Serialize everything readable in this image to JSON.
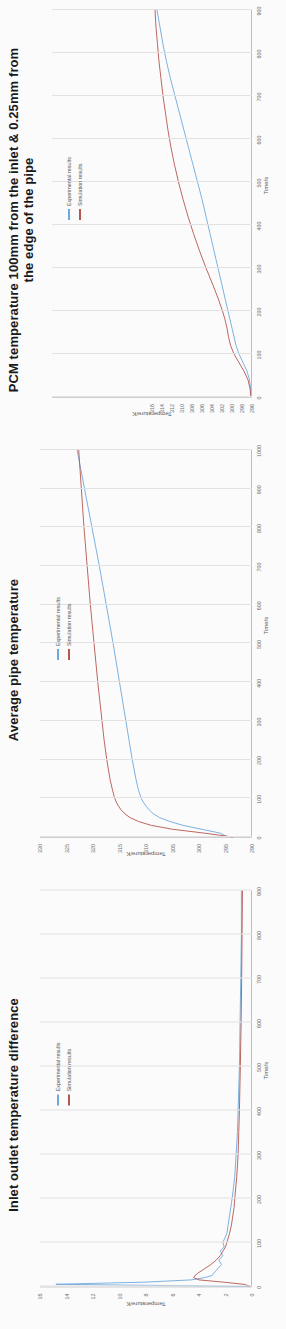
{
  "document": {
    "background": "#fbfbfb",
    "page_kind": "scanned-report-figures"
  },
  "colors": {
    "experimental": "#6fa8dc",
    "simulation": "#b5564f",
    "grid": "#e2e2e2",
    "axis": "#bdbdbd",
    "tick_text": "#6f6f6f",
    "title_text": "#1a1a1a"
  },
  "legend": {
    "experimental_label": "Experimental results",
    "simulation_label": "Simulation results"
  },
  "charts": [
    {
      "id": "pcm-temperature",
      "title_line1": "PCM temperature 100mm from the inlet & 0.25mm from",
      "title_line2": "the edge of the pipe"
    },
    {
      "id": "average-pipe-temperature",
      "title_line1": "Average pipe temperature",
      "title_line2": ""
    },
    {
      "id": "inlet-outlet-temperature-difference",
      "title_line1": "Inlet outlet temperature difference",
      "title_line2": ""
    }
  ],
  "chart_data": [
    {
      "type": "line",
      "title": "PCM temperature 100mm from the inlet & 0.25mm from the edge of the pipe",
      "xlabel": "Time/s",
      "ylabel": "Temperature/K",
      "xlim": [
        0,
        900
      ],
      "ylim": [
        296,
        336
      ],
      "xticks": [
        0,
        100,
        200,
        300,
        400,
        500,
        600,
        700,
        800,
        900
      ],
      "yticks": [
        296,
        298,
        300,
        302,
        304,
        306,
        308,
        310,
        312,
        314,
        316
      ],
      "ytick_labels": [
        "296",
        "298",
        "300",
        "302",
        "304",
        "306",
        "308",
        "310",
        "312",
        "314",
        "316"
      ],
      "grid": true,
      "legend_position": "upper-left",
      "series": [
        {
          "name": "Experimental results",
          "color": "#6fa8dc",
          "x": [
            0,
            20,
            40,
            60,
            80,
            100,
            120,
            140,
            160,
            180,
            200,
            230,
            260,
            300,
            340,
            380,
            420,
            460,
            500,
            540,
            580,
            620,
            660,
            700,
            740,
            780,
            820,
            860,
            900
          ],
          "y": [
            296.2,
            296.3,
            296.5,
            297.0,
            297.8,
            298.6,
            299.2,
            299.6,
            300.0,
            300.4,
            300.8,
            301.4,
            302.0,
            302.8,
            303.6,
            304.4,
            305.2,
            306.0,
            306.9,
            307.8,
            308.7,
            309.6,
            310.5,
            311.4,
            312.3,
            313.1,
            313.8,
            314.4,
            315.0
          ]
        },
        {
          "name": "Simulation results",
          "color": "#b5564f",
          "x": [
            0,
            20,
            40,
            60,
            80,
            100,
            120,
            140,
            160,
            180,
            200,
            230,
            260,
            300,
            340,
            380,
            420,
            460,
            500,
            540,
            580,
            620,
            660,
            700,
            740,
            780,
            820,
            860,
            900
          ],
          "y": [
            296.2,
            296.4,
            296.8,
            297.6,
            298.6,
            299.6,
            300.3,
            300.7,
            301.0,
            301.4,
            301.9,
            302.8,
            303.8,
            305.2,
            306.5,
            307.7,
            308.8,
            309.8,
            310.7,
            311.5,
            312.2,
            312.8,
            313.3,
            313.8,
            314.2,
            314.6,
            314.9,
            315.2,
            315.4
          ]
        }
      ]
    },
    {
      "type": "line",
      "title": "Average pipe temperature",
      "xlabel": "Time/s",
      "ylabel": "Temperature/K",
      "xlim": [
        0,
        1000
      ],
      "ylim": [
        290,
        330
      ],
      "xticks": [
        0,
        100,
        200,
        300,
        400,
        500,
        600,
        700,
        800,
        900,
        1000
      ],
      "yticks": [
        290,
        295,
        300,
        305,
        310,
        315,
        320,
        325,
        330
      ],
      "ytick_labels": [
        "290",
        "295",
        "300",
        "305",
        "310",
        "315",
        "320",
        "325",
        "330"
      ],
      "grid": true,
      "legend_position": "upper-left",
      "series": [
        {
          "name": "Experimental results",
          "color": "#6fa8dc",
          "x": [
            0,
            10,
            20,
            30,
            40,
            50,
            60,
            70,
            80,
            90,
            100,
            120,
            150,
            200,
            250,
            300,
            400,
            500,
            600,
            700,
            800,
            900,
            1000
          ],
          "y": [
            294.6,
            296.0,
            299.5,
            303.0,
            305.5,
            307.4,
            308.6,
            309.4,
            310.0,
            310.5,
            310.9,
            311.4,
            311.9,
            312.6,
            313.2,
            313.8,
            315.0,
            316.2,
            317.5,
            318.8,
            320.2,
            321.6,
            323.0
          ]
        },
        {
          "name": "Simulation results",
          "color": "#b5564f",
          "x": [
            0,
            10,
            20,
            30,
            40,
            50,
            60,
            70,
            80,
            90,
            100,
            120,
            150,
            200,
            250,
            300,
            400,
            500,
            600,
            700,
            800,
            900,
            1000
          ],
          "y": [
            293.6,
            299.0,
            305.0,
            309.0,
            311.4,
            313.0,
            314.0,
            314.7,
            315.2,
            315.6,
            315.9,
            316.3,
            316.8,
            317.4,
            317.9,
            318.3,
            319.1,
            319.8,
            320.5,
            321.1,
            321.7,
            322.2,
            322.7
          ]
        }
      ]
    },
    {
      "type": "line",
      "title": "Inlet outlet temperature difference",
      "xlabel": "Time/s",
      "ylabel": "Temperature/K",
      "xlim": [
        0,
        900
      ],
      "ylim": [
        0,
        16
      ],
      "xticks": [
        0,
        100,
        200,
        300,
        400,
        500,
        600,
        700,
        800,
        900
      ],
      "yticks": [
        0,
        2,
        4,
        6,
        8,
        10,
        12,
        14,
        16
      ],
      "ytick_labels": [
        "0",
        "2",
        "4",
        "6",
        "8",
        "10",
        "12",
        "14",
        "16"
      ],
      "grid": true,
      "legend_position": "upper-left",
      "series": [
        {
          "name": "Experimental results",
          "color": "#6fa8dc",
          "x": [
            0,
            5,
            10,
            15,
            20,
            25,
            30,
            40,
            50,
            60,
            70,
            80,
            90,
            100,
            120,
            140,
            160,
            180,
            200,
            250,
            300,
            350,
            400,
            500,
            600,
            700,
            800,
            900
          ],
          "y": [
            0.2,
            14.8,
            8.0,
            4.6,
            3.6,
            3.0,
            2.9,
            2.6,
            2.3,
            2.5,
            2.2,
            2.4,
            2.1,
            2.2,
            1.9,
            1.8,
            1.7,
            1.6,
            1.5,
            1.3,
            1.2,
            1.1,
            1.05,
            0.95,
            0.9,
            0.85,
            0.8,
            0.8
          ]
        },
        {
          "name": "Simulation results",
          "color": "#b5564f",
          "x": [
            0,
            5,
            10,
            15,
            20,
            25,
            30,
            40,
            50,
            60,
            70,
            80,
            90,
            100,
            120,
            140,
            160,
            180,
            200,
            250,
            300,
            350,
            400,
            500,
            600,
            700,
            800,
            900
          ],
          "y": [
            0.1,
            0.6,
            2.2,
            4.0,
            4.4,
            4.3,
            4.1,
            3.6,
            3.1,
            2.7,
            2.4,
            2.2,
            2.0,
            1.9,
            1.7,
            1.55,
            1.45,
            1.35,
            1.3,
            1.15,
            1.05,
            1.0,
            0.95,
            0.88,
            0.82,
            0.78,
            0.75,
            0.72
          ]
        }
      ]
    }
  ]
}
